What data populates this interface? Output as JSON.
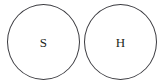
{
  "diagram": {
    "title": "",
    "type": "two-circle-node-diagram",
    "background_color": "#ffffff",
    "stroke_color": "#3a3a3f",
    "label_color": "#231f20",
    "nodes": [
      {
        "id": "s",
        "label": "S",
        "shape": "circle",
        "fill": "#ffffff",
        "stroke": "#3a3a3f"
      },
      {
        "id": "h",
        "label": "H",
        "shape": "circle",
        "fill": "#ffffff",
        "stroke": "#3a3a3f"
      }
    ]
  }
}
